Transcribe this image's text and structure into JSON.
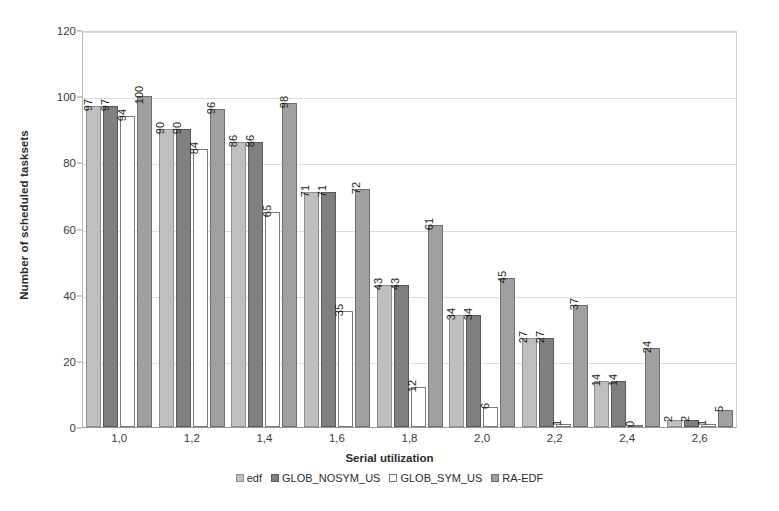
{
  "chart_data": {
    "type": "bar",
    "title": "",
    "xlabel": "Serial utilization",
    "ylabel": "Number of scheduled tasksets",
    "categories": [
      "1,0",
      "1,2",
      "1,4",
      "1,6",
      "1,8",
      "2,0",
      "2,2",
      "2,4",
      "2,6"
    ],
    "ylim": [
      0,
      120
    ],
    "yticks": [
      0,
      20,
      40,
      60,
      80,
      100,
      120
    ],
    "ytick_labels": [
      "0",
      "20",
      "40",
      "60",
      "80",
      "100",
      "120"
    ],
    "grid": true,
    "legend_position": "bottom",
    "series": [
      {
        "name": "edf",
        "color": "#bfbfbf",
        "values": [
          97,
          90,
          86,
          71,
          43,
          34,
          27,
          14,
          2
        ],
        "labels": [
          "97",
          "90",
          "86",
          "71",
          "43",
          "34",
          "27",
          "14",
          "2"
        ]
      },
      {
        "name": "GLOB_NOSYM_US",
        "color": "#808080",
        "values": [
          97,
          90,
          86,
          71,
          43,
          34,
          27,
          14,
          2
        ],
        "labels": [
          "97",
          "90",
          "86",
          "71",
          "43",
          "34",
          "27",
          "14",
          "2"
        ]
      },
      {
        "name": "GLOB_SYM_US",
        "color": "#ffffff",
        "values": [
          94,
          84,
          65,
          35,
          12,
          6,
          1,
          0,
          1
        ],
        "labels": [
          "94",
          "84",
          "65",
          "35",
          "12",
          "6",
          "1",
          "0",
          "1"
        ]
      },
      {
        "name": "RA-EDF",
        "color": "#a0a0a0",
        "values": [
          100,
          96,
          98,
          72,
          61,
          45,
          37,
          24,
          5
        ],
        "labels": [
          "100",
          "96",
          "98",
          "72",
          "61",
          "45",
          "37",
          "24",
          "5"
        ]
      }
    ]
  },
  "legend": {
    "items": [
      {
        "label": "edf",
        "color": "#bfbfbf"
      },
      {
        "label": "GLOB_NOSYM_US",
        "color": "#808080"
      },
      {
        "label": "GLOB_SYM_US",
        "color": "#ffffff"
      },
      {
        "label": "RA-EDF",
        "color": "#a0a0a0"
      }
    ]
  }
}
